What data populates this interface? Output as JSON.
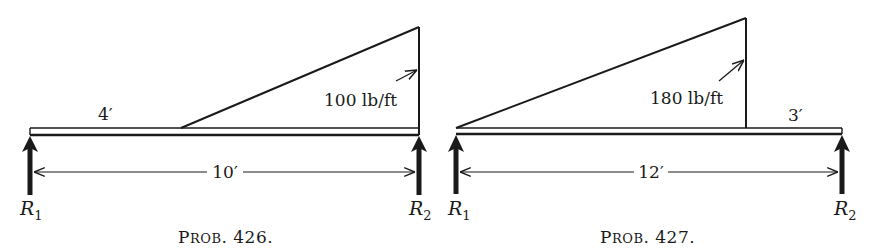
{
  "figures": [
    {
      "id": "prob-426",
      "caption_prefix_big": "P",
      "caption_prefix_small": "ROB",
      "caption_number": ". 426.",
      "span_label": "10′",
      "span_ft": 10,
      "load": {
        "type": "triangular",
        "peak_label": "100 lb/ft",
        "peak_intensity_lb_per_ft": 100,
        "start_ft": 4,
        "end_ft": 10,
        "peak_at": "right"
      },
      "offset_label": "4′",
      "reactions": [
        {
          "name": "R",
          "sub": "1"
        },
        {
          "name": "R",
          "sub": "2"
        }
      ]
    },
    {
      "id": "prob-427",
      "caption_prefix_big": "P",
      "caption_prefix_small": "ROB",
      "caption_number": ". 427.",
      "span_label": "12′",
      "span_ft": 12,
      "load": {
        "type": "triangular",
        "peak_label": "180 lb/ft",
        "peak_intensity_lb_per_ft": 180,
        "start_ft": 0,
        "end_ft": 9,
        "peak_at": "right"
      },
      "offset_label": "3′",
      "reactions": [
        {
          "name": "R",
          "sub": "1"
        },
        {
          "name": "R",
          "sub": "2"
        }
      ]
    }
  ]
}
